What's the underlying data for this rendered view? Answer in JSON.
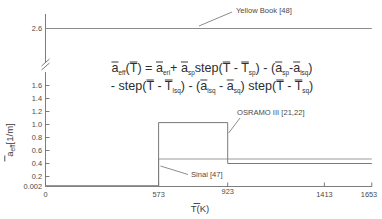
{
  "chart_data": {
    "type": "line",
    "title": "",
    "xlabel": "T(K)",
    "xlabel_overbar": "T",
    "xlabel_suffix": "(K)",
    "ylabel_main": "a",
    "ylabel_sub": "eff",
    "ylabel_suffix": "[1/m]",
    "ylabel": "a_eff[1/m]",
    "xlim": [
      0,
      1653
    ],
    "ylim": [
      0.002,
      2.6
    ],
    "grid": false,
    "legend_position": "inline-annotations",
    "axis_break": {
      "present": true,
      "between": [
        1.6,
        2.6
      ],
      "symbol": "double-slash"
    },
    "xticks": [
      0,
      573,
      923,
      1413,
      1653
    ],
    "xtick_labels": [
      "0",
      "573",
      "923",
      "1413",
      "1653"
    ],
    "yticks": [
      0.002,
      0.2,
      0.4,
      0.6,
      0.8,
      1.0,
      1.2,
      1.4,
      1.6,
      2.6
    ],
    "ytick_labels": [
      "0.002",
      "0.2",
      "0.4",
      "0.6",
      "0.8",
      "1.0",
      "1.2",
      "1.4",
      "1.6",
      "2.6"
    ],
    "series": [
      {
        "name": "Yellow Book [48]",
        "color": "#8c8c8c",
        "x": [
          0,
          1653
        ],
        "values": [
          2.6,
          2.6
        ],
        "step": false
      },
      {
        "name": "OSRAMO III [21,22]",
        "color": "#7a7a7a",
        "x": [
          0,
          573,
          573,
          923,
          923,
          1653
        ],
        "values": [
          0.002,
          0.002,
          1.03,
          1.03,
          0.4,
          0.4
        ],
        "step": true
      },
      {
        "name": "Sinai [47]",
        "color": "#9a9a9a",
        "x": [
          0,
          573,
          573,
          1653
        ],
        "values": [
          0.002,
          0.002,
          0.47,
          0.47
        ],
        "step": true
      }
    ],
    "annotations": [
      {
        "label": "Yellow Book [48]",
        "name": "annotation-yellow-book"
      },
      {
        "label": "OSRAMO III [21,22]",
        "name": "annotation-osramo"
      },
      {
        "label": "Sinai [47]",
        "name": "annotation-sinai"
      }
    ],
    "equation": {
      "line1_parts": [
        {
          "t": "a",
          "bar": true
        },
        {
          "t": "eff",
          "sub": true
        },
        {
          "t": "("
        },
        {
          "t": "T",
          "bar": true
        },
        {
          "t": ") = "
        },
        {
          "t": "a",
          "bar": true
        },
        {
          "t": "erl",
          "sub": true
        },
        {
          "t": "+ "
        },
        {
          "t": "a",
          "bar": true
        },
        {
          "t": "sp",
          "sub": true
        },
        {
          "t": "step("
        },
        {
          "t": "T",
          "bar": true
        },
        {
          "t": " - "
        },
        {
          "t": "T",
          "bar": true
        },
        {
          "t": "sp",
          "sub": true
        },
        {
          "t": ") - ("
        },
        {
          "t": "a",
          "bar": true
        },
        {
          "t": "sp",
          "sub": true
        },
        {
          "t": "-"
        },
        {
          "t": "a",
          "bar": true
        },
        {
          "t": "lsq",
          "sub": true
        },
        {
          "t": ")"
        }
      ],
      "line2_parts": [
        {
          "t": "- step("
        },
        {
          "t": "T",
          "bar": true
        },
        {
          "t": " - "
        },
        {
          "t": "T",
          "bar": true
        },
        {
          "t": "lsq",
          "sub": true
        },
        {
          "t": ") - ("
        },
        {
          "t": "a",
          "bar": true
        },
        {
          "t": "lsq",
          "sub": true
        },
        {
          "t": " - "
        },
        {
          "t": "a",
          "bar": true
        },
        {
          "t": "sq",
          "sub": true
        },
        {
          "t": ") step("
        },
        {
          "t": "T",
          "bar": true
        },
        {
          "t": " - "
        },
        {
          "t": "T",
          "bar": true
        },
        {
          "t": "sq",
          "sub": true
        },
        {
          "t": ")"
        }
      ],
      "line1_plain": "a_eff(T) = a_erl + a_sp step(T - T_sp) - (a_sp - a_lsq)",
      "line2_plain": "- step(T - T_lsq) - (a_lsq - a_sq) step(T - T_sq)"
    }
  }
}
